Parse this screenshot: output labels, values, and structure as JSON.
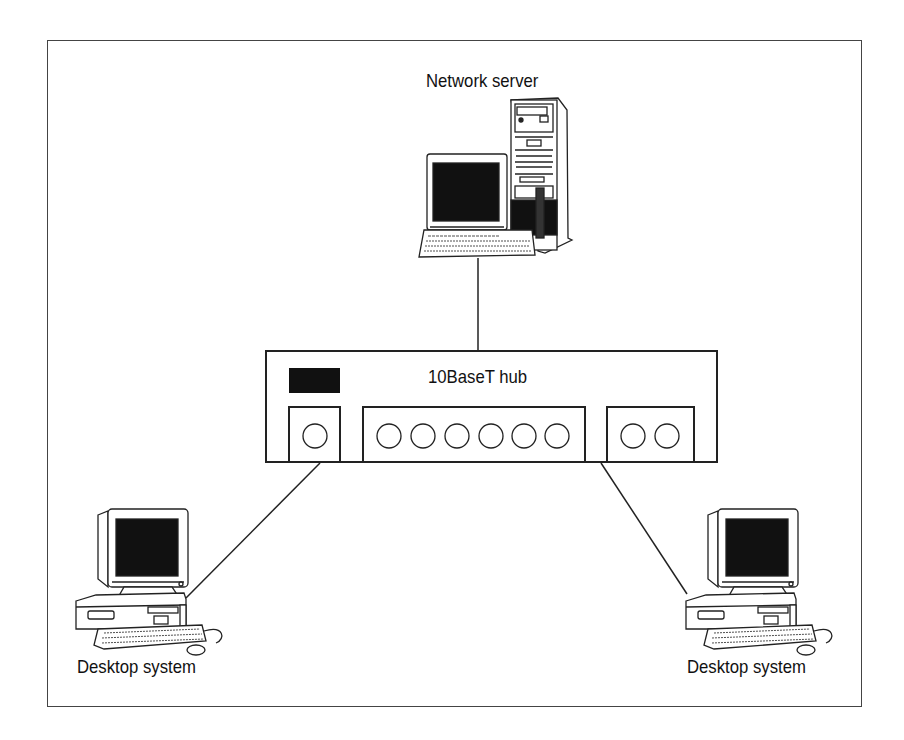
{
  "diagram": {
    "nodes": [
      {
        "id": "server",
        "label": "Network server",
        "type": "server-tower-with-monitor"
      },
      {
        "id": "hub",
        "label": "10BaseT hub",
        "type": "hub",
        "ports": {
          "left_group": 1,
          "middle_group": 6,
          "right_group": 2
        }
      },
      {
        "id": "desktop-left",
        "label": "Desktop system",
        "type": "desktop-computer"
      },
      {
        "id": "desktop-right",
        "label": "Desktop system",
        "type": "desktop-computer"
      }
    ],
    "edges": [
      {
        "from": "server",
        "to": "hub"
      },
      {
        "from": "hub",
        "to": "desktop-left"
      },
      {
        "from": "hub",
        "to": "desktop-right"
      }
    ]
  },
  "labels": {
    "server": "Network server",
    "hub": "10BaseT hub",
    "desktop_left": "Desktop system",
    "desktop_right": "Desktop system"
  },
  "colors": {
    "stroke": "#222222",
    "screen": "#111111",
    "background": "#ffffff"
  }
}
